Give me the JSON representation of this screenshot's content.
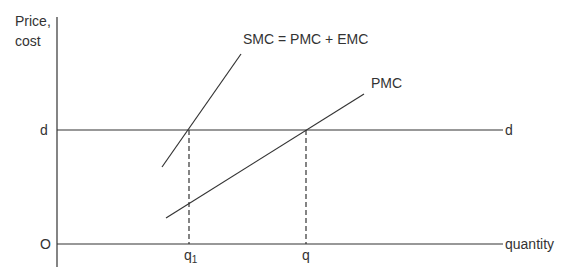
{
  "diagram": {
    "y_axis_label_line1": "Price,",
    "y_axis_label_line2": "cost",
    "x_axis_label": "quantity",
    "origin_label": "O",
    "demand_label_left": "d",
    "demand_label_right": "d",
    "smc_label": "SMC = PMC + EMC",
    "pmc_label": "PMC",
    "q1_label": "q",
    "q1_subscript": "1",
    "q_label": "q"
  }
}
